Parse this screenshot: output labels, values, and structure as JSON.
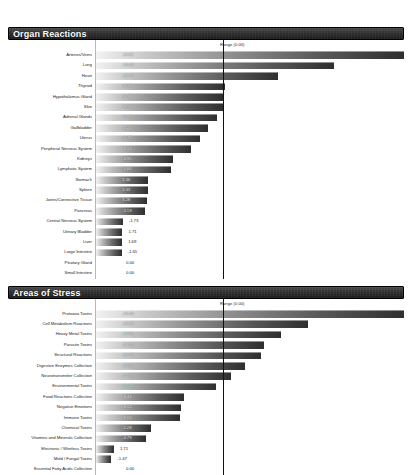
{
  "document": {
    "title": "Organ Reactions and Areas of Stress Report"
  },
  "colors": {
    "header_background": "#2e2e2e",
    "header_text": "#ffffff",
    "bar_gradient_start": "#f2f2f2",
    "bar_gradient_end": "#2f2f2f",
    "divider": "#111111",
    "page_background": "#ffffff",
    "label_text": "#1d1d1d"
  },
  "panels": [
    {
      "id": "organ-reactions",
      "title": "Organ Reactions",
      "range_label": "Range (0.00)",
      "rows": [
        {
          "label": "Arteries/Veins",
          "value": "-19.91"
        },
        {
          "label": "Lung",
          "value": "-15.40"
        },
        {
          "label": "Heart",
          "value": "-11.77"
        },
        {
          "label": "Thyroid",
          "value": "-8.33"
        },
        {
          "label": "Hypothalamus Gland",
          "value": "-8.18"
        },
        {
          "label": "Skin",
          "value": "-8.19"
        },
        {
          "label": "Adrenal Glands",
          "value": "-7.85"
        },
        {
          "label": "Gallbladder",
          "value": "-7.21"
        },
        {
          "label": "Uterus",
          "value": "-6.74"
        },
        {
          "label": "Peripheral Nervous System",
          "value": "-6.13"
        },
        {
          "label": "Kidneys",
          "value": "-4.95"
        },
        {
          "label": "Lymphatic System",
          "value": "-4.84"
        },
        {
          "label": "Stomach",
          "value": "3.36"
        },
        {
          "label": "Spleen",
          "value": "3.33"
        },
        {
          "label": "Joints/Connective Tissue",
          "value": "3.28"
        },
        {
          "label": "Pancreas",
          "value": "-3.19"
        },
        {
          "label": "Central Nervous System",
          "value": "-1.73"
        },
        {
          "label": "Urinary Bladder",
          "value": "1.71"
        },
        {
          "label": "Liver",
          "value": "1.69"
        },
        {
          "label": "Large Intestine",
          "value": "-1.65"
        },
        {
          "label": "Pituitary Gland",
          "value": "0.00"
        },
        {
          "label": "Small Intestine",
          "value": "0.00"
        }
      ]
    },
    {
      "id": "areas-of-stress",
      "title": "Areas of Stress",
      "range_label": "Range (0.00)",
      "rows": [
        {
          "label": "Protozoa Toxins",
          "value": "-29.46"
        },
        {
          "label": "Cell Metabolism Reactions",
          "value": "-20.23"
        },
        {
          "label": "Heavy Metal Toxins",
          "value": "-17.68"
        },
        {
          "label": "Parasite Toxins",
          "value": "-16.05"
        },
        {
          "label": "Structural Reactions",
          "value": "-15.76"
        },
        {
          "label": "Digestive Enzymes Collection",
          "value": "-14.25"
        },
        {
          "label": "Neurotransmitter Collection",
          "value": "-12.87"
        },
        {
          "label": "Environmental Toxins",
          "value": "-11.44"
        },
        {
          "label": "Food Reactions Collection",
          "value": "-8.44"
        },
        {
          "label": "Negative Emotions",
          "value": "-8.12"
        },
        {
          "label": "Immune Toxins",
          "value": "-8.02"
        },
        {
          "label": "Chemical Toxins",
          "value": "-5.28"
        },
        {
          "label": "Vitamins and Minerals Collection",
          "value": "-4.79"
        },
        {
          "label": "Electronic / Wireless Toxins",
          "value": "1.71"
        },
        {
          "label": "Mold / Fungal Toxins",
          "value": "-1.47"
        },
        {
          "label": "Essential Fatty Acids Collection",
          "value": "0.00"
        },
        {
          "label": "Hormone Collection",
          "value": "0.00"
        }
      ]
    }
  ],
  "chart_data": [
    {
      "type": "bar",
      "orientation": "horizontal",
      "title": "Organ Reactions",
      "xlabel": "",
      "ylabel": "",
      "grid": false,
      "legend": "none",
      "reference_line_label": "Range (0.00)",
      "categories": [
        "Arteries/Veins",
        "Lung",
        "Heart",
        "Thyroid",
        "Hypothalamus Gland",
        "Skin",
        "Adrenal Glands",
        "Gallbladder",
        "Uterus",
        "Peripheral Nervous System",
        "Kidneys",
        "Lymphatic System",
        "Stomach",
        "Spleen",
        "Joints/Connective Tissue",
        "Pancreas",
        "Central Nervous System",
        "Urinary Bladder",
        "Liver",
        "Large Intestine",
        "Pituitary Gland",
        "Small Intestine"
      ],
      "values": [
        -19.91,
        -15.4,
        -11.77,
        -8.33,
        -8.18,
        -8.19,
        -7.85,
        -7.21,
        -6.74,
        -6.13,
        -4.95,
        -4.84,
        3.36,
        3.33,
        3.28,
        -3.19,
        -1.73,
        1.71,
        1.69,
        -1.65,
        0.0,
        0.0
      ],
      "magnitude_max": 19.91
    },
    {
      "type": "bar",
      "orientation": "horizontal",
      "title": "Areas of Stress",
      "xlabel": "",
      "ylabel": "",
      "grid": false,
      "legend": "none",
      "reference_line_label": "Range (0.00)",
      "categories": [
        "Protozoa Toxins",
        "Cell Metabolism Reactions",
        "Heavy Metal Toxins",
        "Parasite Toxins",
        "Structural Reactions",
        "Digestive Enzymes Collection",
        "Neurotransmitter Collection",
        "Environmental Toxins",
        "Food Reactions Collection",
        "Negative Emotions",
        "Immune Toxins",
        "Chemical Toxins",
        "Vitamins and Minerals Collection",
        "Electronic / Wireless Toxins",
        "Mold / Fungal Toxins",
        "Essential Fatty Acids Collection",
        "Hormone Collection"
      ],
      "values": [
        -29.46,
        -20.23,
        -17.68,
        -16.05,
        -15.76,
        -14.25,
        -12.87,
        -11.44,
        -8.44,
        -8.12,
        -8.02,
        -5.28,
        -4.79,
        1.71,
        -1.47,
        0.0,
        0.0
      ],
      "magnitude_max": 29.46
    }
  ]
}
